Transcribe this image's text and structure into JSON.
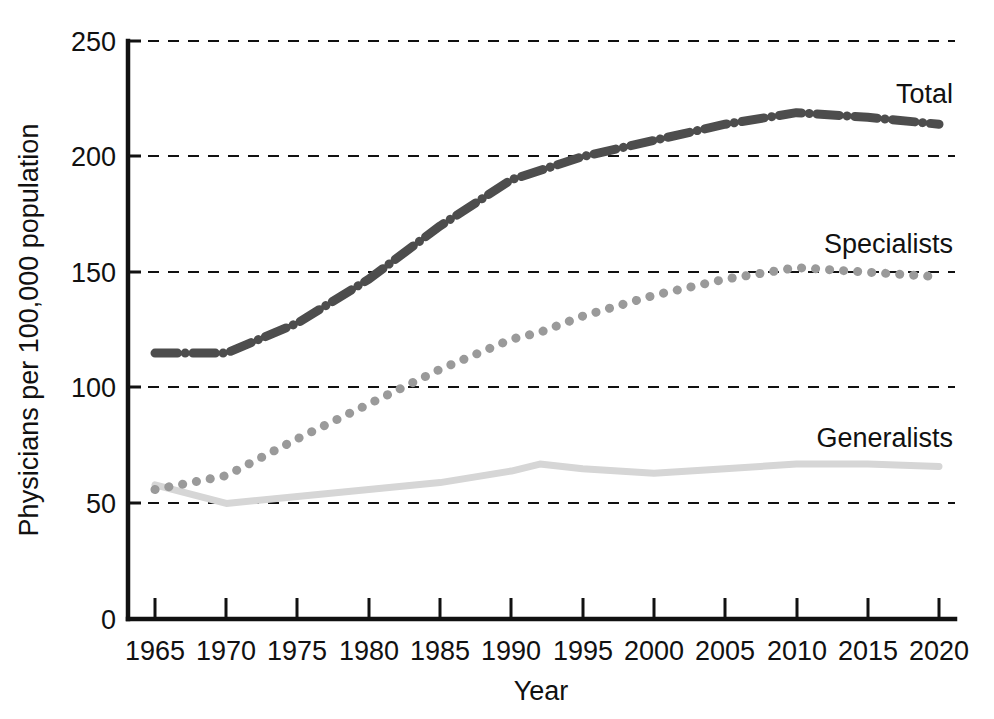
{
  "chart_data": {
    "type": "line",
    "title": "",
    "xlabel": "Year",
    "ylabel": "Physicians per 100,000 population",
    "xlim": [
      1963,
      2022
    ],
    "ylim": [
      0,
      250
    ],
    "yticks": [
      0,
      50,
      100,
      150,
      200,
      250
    ],
    "ytick_labels": [
      "0",
      "50",
      "100",
      "150",
      "200",
      "250"
    ],
    "xticks": [
      1965,
      1970,
      1975,
      1980,
      1985,
      1990,
      1995,
      2000,
      2005,
      2010,
      2015,
      2020
    ],
    "xtick_labels": [
      "1965",
      "1970",
      "1975",
      "1980",
      "1985",
      "1990",
      "1995",
      "2000",
      "2005",
      "2010",
      "2015",
      "2020"
    ],
    "grid": "horizontal-dashed",
    "legend_position": "inline-right-of-series",
    "x": [
      1965,
      1970,
      1975,
      1980,
      1985,
      1990,
      1992,
      1995,
      2000,
      2005,
      2010,
      2015,
      2020
    ],
    "series": [
      {
        "name": "Total",
        "label": "Total",
        "color": "#4d4d4d",
        "linestyle": "dashdot",
        "linewidth": 9,
        "values": [
          115,
          115,
          128,
          147,
          170,
          190,
          194,
          200,
          207,
          214,
          219,
          217,
          214
        ],
        "label_x": 2018,
        "label_y": 233
      },
      {
        "name": "Specialists",
        "label": "Specialists",
        "color": "#9a9a9a",
        "linestyle": "dotted",
        "linewidth": 9,
        "values": [
          56,
          62,
          78,
          93,
          108,
          121,
          124,
          131,
          140,
          147,
          152,
          150,
          148
        ],
        "label_x": 2015,
        "label_y": 168
      },
      {
        "name": "Generalists",
        "label": "Generalists",
        "color": "#d6d6d6",
        "linestyle": "solid",
        "linewidth": 7,
        "values": [
          58,
          50,
          53,
          56,
          59,
          64,
          67,
          65,
          63,
          65,
          67,
          67,
          66
        ],
        "label_x": 2014,
        "label_y": 81
      }
    ]
  },
  "axes": {
    "y_axis_title": "Physicians per 100,000 population",
    "x_axis_title": "Year"
  }
}
